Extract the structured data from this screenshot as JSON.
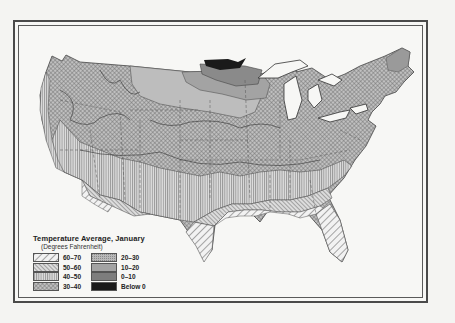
{
  "legend": {
    "title": "Temperature Average, January",
    "subtitle": "(Degrees Fahrenheit)",
    "items": [
      {
        "label": "60–70",
        "pattern": "diag-coarse",
        "color": "#ffffff"
      },
      {
        "label": "50–60",
        "pattern": "diag-fine",
        "color": "#cfcfcf"
      },
      {
        "label": "40–50",
        "pattern": "vertical",
        "color": "#d6d6d6"
      },
      {
        "label": "30–40",
        "pattern": "crosshatch",
        "color": "#a9a9a9"
      },
      {
        "label": "20–30",
        "pattern": "stipple",
        "color": "#b3b3b3"
      },
      {
        "label": "10–20",
        "pattern": "solid-light",
        "color": "#c2c2c2"
      },
      {
        "label": "0–10",
        "pattern": "solid-mid",
        "color": "#8c8c8c"
      },
      {
        "label": "Below 0",
        "pattern": "solid-dark",
        "color": "#1a1a1a"
      }
    ]
  },
  "map": {
    "subject": "United States",
    "regions": [
      "Pacific Northwest",
      "Great Plains",
      "Northern Minnesota",
      "Great Lakes",
      "New England",
      "Gulf Coast",
      "Florida",
      "Texas",
      "Southwest"
    ]
  }
}
